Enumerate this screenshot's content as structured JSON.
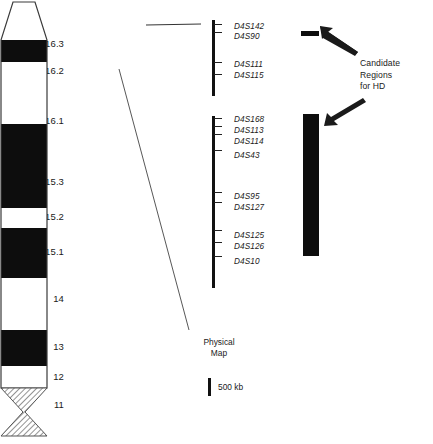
{
  "figure": {
    "arm_label": "4p",
    "chromosome_bands": [
      {
        "label": "16.3",
        "label_y": 38,
        "y": 16,
        "h": 38,
        "stain": "white"
      },
      {
        "label": "16.2",
        "label_y": 65,
        "y": 54,
        "h": 22,
        "stain": "black"
      },
      {
        "label": "16.1",
        "label_y": 115,
        "y": 76,
        "h": 62,
        "stain": "white"
      },
      {
        "label": "15.3",
        "label_y": 176,
        "y": 138,
        "h": 84,
        "stain": "black"
      },
      {
        "label": "15.2",
        "label_y": 211,
        "y": 222,
        "h": 20,
        "stain": "white"
      },
      {
        "label": "15.1",
        "label_y": 246,
        "y": 242,
        "h": 50,
        "stain": "black"
      },
      {
        "label": "14",
        "label_y": 293,
        "y": 292,
        "h": 52,
        "stain": "white"
      },
      {
        "label": "13",
        "label_y": 341,
        "y": 344,
        "h": 36,
        "stain": "black"
      },
      {
        "label": "12",
        "label_y": 371,
        "y": 380,
        "h": 22,
        "stain": "white"
      },
      {
        "label": "11",
        "label_y": 399,
        "y": 402,
        "h": 36,
        "stain": "hatched"
      }
    ],
    "physical_map": {
      "segments": [
        {
          "id": "upper-segment",
          "y": 20,
          "h": 76,
          "ticks": [
            24,
            32,
            62,
            74
          ],
          "markers": [
            {
              "name": "D4S142",
              "y": 22
            },
            {
              "name": "D4S90",
              "y": 32
            },
            {
              "name": "D4S111",
              "y": 60
            },
            {
              "name": "D4S115",
              "y": 71
            }
          ]
        },
        {
          "id": "lower-segment",
          "y": 116,
          "h": 172,
          "ticks": [
            118,
            126,
            134,
            150,
            192,
            202,
            230,
            242,
            256
          ],
          "markers": [
            {
              "name": "D4S168",
              "y": 115
            },
            {
              "name": "D4S113",
              "y": 126
            },
            {
              "name": "D4S114",
              "y": 137
            },
            {
              "name": "D4S43",
              "y": 151
            },
            {
              "name": "D4S95",
              "y": 192
            },
            {
              "name": "D4S127",
              "y": 203
            },
            {
              "name": "D4S125",
              "y": 231
            },
            {
              "name": "D4S126",
              "y": 242
            },
            {
              "name": "D4S10",
              "y": 257
            }
          ]
        }
      ],
      "caption": "Physical\nMap",
      "caption_line1": "Physical",
      "caption_line2": "Map",
      "scale_label": "500 kb"
    },
    "candidate_regions": {
      "annotation_line1": "Candidate",
      "annotation_line2": "Regions",
      "annotation_line3": "for HD",
      "bars": [
        {
          "id": "candidate-bar-upper",
          "x": 301,
          "y": 31,
          "w": 18,
          "h": 5
        },
        {
          "id": "candidate-bar-lower",
          "x": 303,
          "y": 114,
          "w": 16,
          "h": 142
        }
      ]
    },
    "colors": {
      "band_dark": "#0d0d0d",
      "band_light": "#ffffff",
      "outline": "#3a3a3a",
      "map_line": "#111111",
      "text": "#1a1a1a"
    }
  }
}
